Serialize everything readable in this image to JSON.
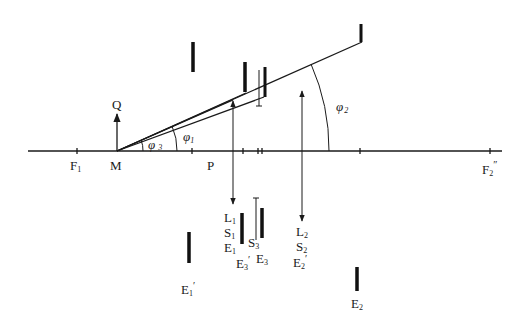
{
  "diagram": {
    "axis": {
      "start_x": 28,
      "end_x": 502,
      "y": 151,
      "ticks": [
        77,
        192,
        243,
        258,
        262,
        360,
        490
      ]
    },
    "points": {
      "F1": {
        "label": "F",
        "sub": "1",
        "x": 77,
        "lx": 70,
        "ly": 170
      },
      "M": {
        "label": "M",
        "x": 117,
        "lx": 110,
        "ly": 170
      },
      "P": {
        "label": "P",
        "x": 210,
        "lx": 208,
        "ly": 170
      },
      "F2pp": {
        "label": "F",
        "sub": "2",
        "prime": "″",
        "x": 490,
        "lx": 482,
        "ly": 173
      }
    },
    "vector_Q": {
      "label": "Q",
      "x": 117,
      "y_top": 113,
      "ly": 109
    },
    "angles": {
      "phi1": {
        "label": "φ",
        "sub": "1",
        "lx": 183,
        "ly": 143
      },
      "phi2": {
        "label": "φ",
        "sub": "2",
        "lx": 336,
        "ly": 111
      },
      "phi3": {
        "label": "φ",
        "sub": "3",
        "lx": 150,
        "ly": 148
      }
    },
    "rays": [
      {
        "x1": 117,
        "y1": 151,
        "x2": 362,
        "y2": 42
      },
      {
        "x1": 117,
        "y1": 151,
        "x2": 246,
        "y2": 93
      },
      {
        "x1": 117,
        "y1": 151,
        "x2": 233,
        "y2": 100
      },
      {
        "x1": 117,
        "y1": 151,
        "x2": 264,
        "y2": 97
      }
    ],
    "objects_top": [
      {
        "name": "object-bar-1",
        "x": 193,
        "y1": 42,
        "y2": 72,
        "w": 3.5
      },
      {
        "name": "object-bar-2",
        "x": 245,
        "y1": 62,
        "y2": 92,
        "w": 3.5
      },
      {
        "name": "object-bar-3",
        "x": 265,
        "y1": 67,
        "y2": 97,
        "w": 3
      },
      {
        "name": "object-bar-4",
        "x": 361,
        "y1": 24,
        "y2": 42,
        "w": 3
      }
    ],
    "thin_markers": [
      {
        "x": 259,
        "y1": 70,
        "y2": 106
      }
    ],
    "vertical_arrows": [
      {
        "name": "arrow-L1",
        "x": 233,
        "y1": 100,
        "y2": 205,
        "head": "both"
      },
      {
        "name": "arrow-L2",
        "x": 302,
        "y1": 90,
        "y2": 222,
        "head": "both"
      }
    ],
    "images_bottom": [
      {
        "name": "image-bar-E1p",
        "x": 189,
        "y1": 232,
        "y2": 263,
        "w": 3.5
      },
      {
        "name": "image-bar-E1",
        "x": 242,
        "y1": 213,
        "y2": 244,
        "w": 3.5
      },
      {
        "name": "image-bar-E3",
        "x": 262,
        "y1": 208,
        "y2": 238,
        "w": 3.5
      },
      {
        "name": "image-bar-E2",
        "x": 357,
        "y1": 267,
        "y2": 291,
        "w": 3.5
      }
    ],
    "thin_bottom": [
      {
        "x": 256,
        "y1": 198,
        "y2": 240
      }
    ],
    "labels_bottom": {
      "L1": {
        "l": "L",
        "s": "1",
        "x": 224,
        "y": 222
      },
      "S1": {
        "l": "S",
        "s": "1",
        "x": 224,
        "y": 237
      },
      "E1": {
        "l": "E",
        "s": "1",
        "x": 224,
        "y": 252
      },
      "S3": {
        "l": "S",
        "s": "3",
        "x": 248,
        "y": 247
      },
      "E3p": {
        "l": "E",
        "s": "3",
        "p": "′",
        "x": 236,
        "y": 268
      },
      "E3": {
        "l": "E",
        "s": "3",
        "x": 256,
        "y": 263
      },
      "L2": {
        "l": "L",
        "s": "2",
        "x": 296,
        "y": 236
      },
      "S2": {
        "l": "S",
        "s": "2",
        "x": 296,
        "y": 251
      },
      "E2p": {
        "l": "E",
        "s": "2",
        "p": "′",
        "x": 293,
        "y": 267
      },
      "E1p": {
        "l": "E",
        "s": "1",
        "p": "′",
        "x": 181,
        "y": 294
      },
      "E2": {
        "l": "E",
        "s": "2",
        "x": 351,
        "y": 308
      }
    }
  }
}
